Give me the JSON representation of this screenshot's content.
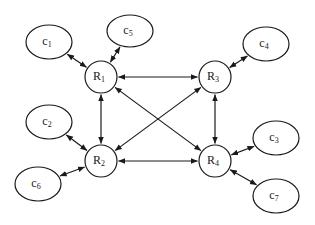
{
  "diagram": {
    "type": "network-graph",
    "background": "#ffffff",
    "stroke_color": "#1a1a1a",
    "routers": [
      {
        "id": "R1",
        "label": "R",
        "sub": "1",
        "cx": 101,
        "cy": 77,
        "r": 16
      },
      {
        "id": "R2",
        "label": "R",
        "sub": "2",
        "cx": 101,
        "cy": 161,
        "r": 16
      },
      {
        "id": "R3",
        "label": "R",
        "sub": "3",
        "cx": 215,
        "cy": 77,
        "r": 16
      },
      {
        "id": "R4",
        "label": "R",
        "sub": "4",
        "cx": 215,
        "cy": 161,
        "r": 16
      }
    ],
    "clients": [
      {
        "id": "c1",
        "label": "c",
        "sub": "1",
        "cx": 49,
        "cy": 42,
        "rx": 23,
        "ry": 17
      },
      {
        "id": "c5",
        "label": "c",
        "sub": "5",
        "cx": 130,
        "cy": 31,
        "rx": 23,
        "ry": 16
      },
      {
        "id": "c4",
        "label": "c",
        "sub": "4",
        "cx": 266,
        "cy": 44,
        "rx": 23,
        "ry": 17
      },
      {
        "id": "c2",
        "label": "c",
        "sub": "2",
        "cx": 49,
        "cy": 122,
        "rx": 23,
        "ry": 17
      },
      {
        "id": "c6",
        "label": "c",
        "sub": "6",
        "cx": 38,
        "cy": 184,
        "rx": 23,
        "ry": 17
      },
      {
        "id": "c3",
        "label": "c",
        "sub": "3",
        "cx": 276,
        "cy": 138,
        "rx": 23,
        "ry": 17
      },
      {
        "id": "c7",
        "label": "c",
        "sub": "7",
        "cx": 276,
        "cy": 196,
        "rx": 23,
        "ry": 17
      }
    ],
    "edges": [
      {
        "from": "R1",
        "to": "R3",
        "bidirectional": true
      },
      {
        "from": "R1",
        "to": "R2",
        "bidirectional": true
      },
      {
        "from": "R3",
        "to": "R4",
        "bidirectional": true
      },
      {
        "from": "R2",
        "to": "R4",
        "bidirectional": true
      },
      {
        "from": "R1",
        "to": "R4",
        "bidirectional": true
      },
      {
        "from": "R3",
        "to": "R2",
        "bidirectional": true
      },
      {
        "from": "c1",
        "to": "R1",
        "bidirectional": true
      },
      {
        "from": "c5",
        "to": "R1",
        "bidirectional": true
      },
      {
        "from": "c4",
        "to": "R3",
        "bidirectional": true
      },
      {
        "from": "c2",
        "to": "R2",
        "bidirectional": true
      },
      {
        "from": "c6",
        "to": "R2",
        "bidirectional": true
      },
      {
        "from": "c3",
        "to": "R4",
        "bidirectional": true
      },
      {
        "from": "c7",
        "to": "R4",
        "bidirectional": true
      }
    ]
  }
}
